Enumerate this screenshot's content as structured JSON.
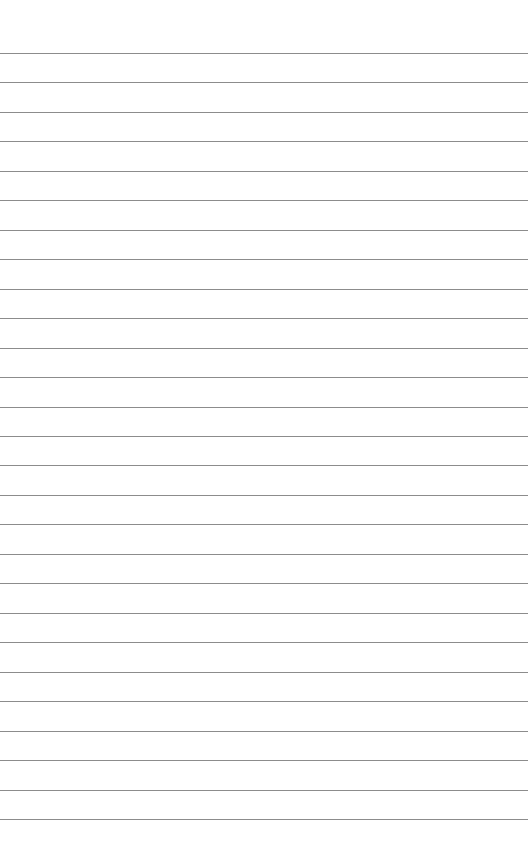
{
  "page": {
    "type": "lined-paper",
    "line_count": 27,
    "first_line_y": 53,
    "line_spacing": 29.46,
    "line_color": "#8c8c8c",
    "background_color": "#ffffff"
  }
}
